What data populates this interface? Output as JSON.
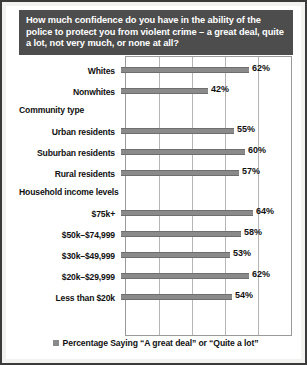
{
  "title": "How much confidence do you have in the ability of the police to protect you from violent crime – a great deal, quite a lot, not very much, or none at all?",
  "legend": {
    "label": "Percentage Saying “A great deal” or “Quite a lot”",
    "swatch_color": "#8a8a8a"
  },
  "colors": {
    "bar": "#8a8a8a",
    "title_band": "#4d4d4d",
    "title_text": "#ffffff",
    "gridline": "#b5b5b5",
    "frame": "#3b3b3b"
  },
  "groups": [
    {
      "header": "",
      "rows": [
        {
          "label": "Whites",
          "value": 62,
          "value_label": "62%"
        },
        {
          "label": "Nonwhites",
          "value": 42,
          "value_label": "42%"
        }
      ]
    },
    {
      "header": "Community type",
      "rows": [
        {
          "label": "Urban residents",
          "value": 55,
          "value_label": "55%"
        },
        {
          "label": "Suburban residents",
          "value": 60,
          "value_label": "60%"
        },
        {
          "label": "Rural residents",
          "value": 57,
          "value_label": "57%"
        }
      ]
    },
    {
      "header": "Household income levels",
      "rows": [
        {
          "label": "$75k+",
          "value": 64,
          "value_label": "64%"
        },
        {
          "label": "$50k–$74,999",
          "value": 58,
          "value_label": "58%"
        },
        {
          "label": "$30k–$49,999",
          "value": 53,
          "value_label": "53%"
        },
        {
          "label": "$20k–$29,999",
          "value": 62,
          "value_label": "62%"
        },
        {
          "label": "Less than $20k",
          "value": 54,
          "value_label": "54%"
        }
      ]
    }
  ],
  "chart_data": {
    "type": "bar",
    "orientation": "horizontal",
    "title": "How much confidence do you have in the ability of the police to protect you from violent crime – a great deal, quite a lot, not very much, or none at all?",
    "xlabel": "",
    "ylabel": "",
    "xlim": [
      0,
      80
    ],
    "gridlines": [
      16,
      32,
      48,
      64
    ],
    "grid": true,
    "legend_position": "bottom",
    "legend_entries": [
      "Percentage Saying “A great deal” or “Quite a lot”"
    ],
    "categories": [
      "Whites",
      "Nonwhites",
      "Urban residents",
      "Suburban residents",
      "Rural residents",
      "$75k+",
      "$50k–$74,999",
      "$30k–$49,999",
      "$20k–$29,999",
      "Less than $20k"
    ],
    "values": [
      62,
      42,
      55,
      60,
      57,
      64,
      58,
      53,
      62,
      54
    ],
    "group_headers": [
      "Community type",
      "Household income levels"
    ],
    "units": "percent"
  }
}
